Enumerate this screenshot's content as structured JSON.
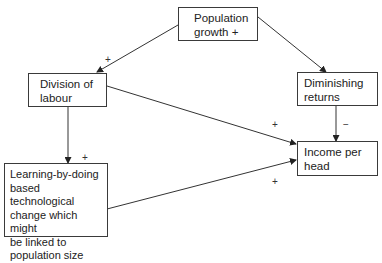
{
  "nodes": {
    "population": {
      "label": "Population\ngrowth +"
    },
    "division": {
      "label": "Division of\nlabour"
    },
    "diminishing": {
      "label": "Diminishing\nreturns"
    },
    "income": {
      "label": "Income per\nhead"
    },
    "learning": {
      "label": "Learning-by-doing\nbased technological\nchange which might\nbe linked to\npopulation size"
    }
  },
  "edges": [
    {
      "from": "population",
      "to": "division",
      "sign": "+"
    },
    {
      "from": "population",
      "to": "diminishing",
      "sign": ""
    },
    {
      "from": "division",
      "to": "income",
      "sign": "+"
    },
    {
      "from": "diminishing",
      "to": "income",
      "sign": "−"
    },
    {
      "from": "division",
      "to": "learning",
      "sign": "+"
    },
    {
      "from": "learning",
      "to": "income",
      "sign": "+"
    }
  ],
  "signs": {
    "pop_div": "+",
    "div_income": "+",
    "dim_income": "−",
    "div_learning": "+",
    "learning_income": "+"
  }
}
